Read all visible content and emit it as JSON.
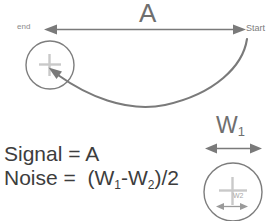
{
  "diagram": {
    "title_label": "A",
    "endpoints": {
      "left_label": "end",
      "right_label": "Start"
    },
    "width_labels": {
      "w1": "W",
      "w1_sub": "1",
      "w2_small": "W2"
    },
    "equations": {
      "signal_lhs": "Signal = A",
      "noise_prefix": "Noise =  (W",
      "noise_sub1": "1",
      "noise_mid": "-W",
      "noise_sub2": "2",
      "noise_suffix": ")/2"
    },
    "markers": {
      "plus_left": "plus-crosshair",
      "plus_right": "plus-crosshair"
    },
    "colors": {
      "stroke": "#7a7a7a",
      "stroke_light": "#9a9a9a",
      "crosshair": "#c9c9c9",
      "text_dark": "#3d3d3d",
      "text_mid": "#6f6f6f",
      "text_light": "#8a8a8a",
      "background": "#ffffff"
    }
  }
}
